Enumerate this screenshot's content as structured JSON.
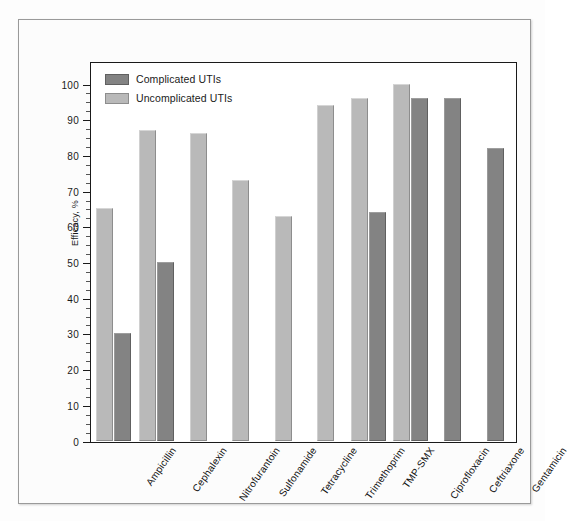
{
  "chart_data": {
    "type": "bar",
    "title": "",
    "xlabel": "",
    "ylabel": "Efficacy, %",
    "ylim": [
      0,
      100
    ],
    "ytick_step": 10,
    "yticks": [
      0,
      10,
      20,
      30,
      40,
      50,
      60,
      70,
      80,
      90,
      100
    ],
    "grid": false,
    "legend_position": "top-left",
    "categories": [
      "Ampicillin",
      "Cephalexin",
      "Nitrofurantoin",
      "Sulfonamide",
      "Tetracycline",
      "Trimethoprim",
      "TMP-SMX",
      "Ciprofloxacin",
      "Ceftriaxone",
      "Gentamicin"
    ],
    "series": [
      {
        "name": "Uncomplicated UTIs",
        "color": "#b9b9b9",
        "values": [
          65,
          87,
          86,
          73,
          63,
          94,
          96,
          100,
          null,
          null
        ]
      },
      {
        "name": "Complicated UTIs",
        "color": "#838383",
        "values": [
          30,
          50,
          null,
          null,
          null,
          null,
          64,
          96,
          96,
          82
        ]
      }
    ]
  },
  "legend": {
    "items": [
      {
        "label": "Complicated UTIs",
        "swatch": "complicated"
      },
      {
        "label": "Uncomplicated UTIs",
        "swatch": "uncomplicated"
      }
    ]
  }
}
